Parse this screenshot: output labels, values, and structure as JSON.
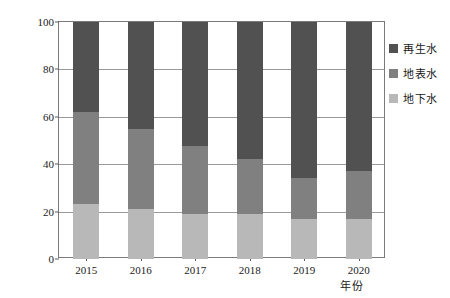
{
  "chart_data": {
    "type": "bar",
    "subtype": "stacked-100-percent",
    "title": "",
    "xlabel": "年份",
    "ylabel": "水量占比/%",
    "categories": [
      "2015",
      "2016",
      "2017",
      "2018",
      "2019",
      "2020"
    ],
    "ylim": [
      0,
      100
    ],
    "yticks": [
      0,
      20,
      40,
      60,
      80,
      100
    ],
    "ytick_labels": [
      "0",
      "20",
      "40",
      "60",
      "80",
      "100"
    ],
    "grid": "horizontal",
    "legend_position": "right-outside",
    "stack_order_bottom_to_top": [
      "地下水",
      "地表水",
      "再生水"
    ],
    "series": [
      {
        "name": "地下水",
        "color": "#b8b8b8",
        "values": [
          23,
          21,
          19,
          19,
          17,
          17
        ]
      },
      {
        "name": "地表水",
        "color": "#808080",
        "values": [
          39,
          34,
          28.5,
          23,
          17,
          20
        ]
      },
      {
        "name": "再生水",
        "color": "#515151",
        "values": [
          38,
          45,
          52.5,
          58,
          66,
          63
        ]
      }
    ],
    "cumulative_tops": {
      "地下水": [
        23,
        21,
        19,
        19,
        17,
        17
      ],
      "地表水": [
        62,
        55,
        47.5,
        42,
        34,
        37
      ],
      "再生水": [
        100,
        100,
        100,
        100,
        100,
        100
      ]
    }
  },
  "legend": {
    "items": [
      {
        "label": "再生水",
        "color": "#515151"
      },
      {
        "label": "地表水",
        "color": "#808080"
      },
      {
        "label": "地下水",
        "color": "#b8b8b8"
      }
    ]
  },
  "axes": {
    "frame_color": "#7a7a7a",
    "grid_color": "#9a9a9a"
  }
}
